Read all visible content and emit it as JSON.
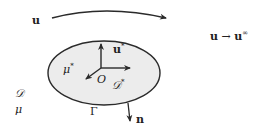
{
  "diagram": {
    "labels": {
      "u_far": "u",
      "u_limit_lhs": "u",
      "arrow": "→",
      "u_limit_rhs": "u",
      "u_limit_sup": "∞",
      "u_star": "u",
      "u_star_sup": "*",
      "mu_star": "μ",
      "mu_star_sup": "*",
      "origin": "O",
      "D_star": "𝒟",
      "D_star_sup": "*",
      "D": "𝒟",
      "mu": "μ",
      "Gamma": "Γ",
      "n": "n"
    },
    "colors": {
      "ellipse_fill": "#ececec",
      "stroke": "#2a2a2a"
    }
  }
}
